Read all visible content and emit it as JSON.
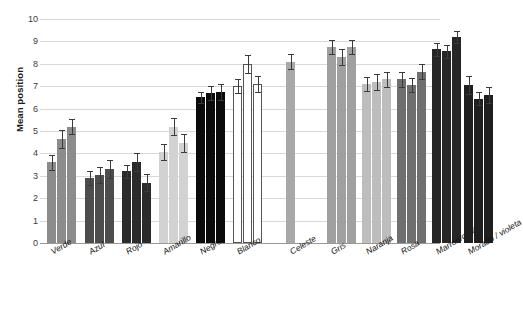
{
  "chart_data": {
    "type": "bar",
    "title": "",
    "xlabel": "",
    "ylabel": "Mean position",
    "ylim": [
      0,
      10
    ],
    "ytick_labels": [
      "0",
      "1",
      "2",
      "3",
      "4",
      "5",
      "6",
      "7",
      "8",
      "9",
      "10"
    ],
    "grid": true,
    "legend": "none",
    "error_bars": true,
    "categories": [
      "Verde",
      "Azul",
      "Rojo",
      "Amarillo",
      "Negro",
      "Blanco",
      "Celeste",
      "Gris",
      "Naranja",
      "Rosa",
      "Marrón/café",
      "Morado / violeta"
    ],
    "groups": [
      {
        "label": "Verde",
        "fill": "#8c8c8c",
        "bars": [
          {
            "value": 3.6,
            "err_low": 0.35,
            "err_high": 0.35
          },
          {
            "value": 4.65,
            "err_low": 0.4,
            "err_high": 0.4
          },
          {
            "value": 5.2,
            "err_low": 0.35,
            "err_high": 0.35
          }
        ]
      },
      {
        "label": "Azul",
        "fill": "#4d4d4d",
        "bars": [
          {
            "value": 2.9,
            "err_low": 0.3,
            "err_high": 0.3
          },
          {
            "value": 3.05,
            "err_low": 0.35,
            "err_high": 0.35
          },
          {
            "value": 3.3,
            "err_low": 0.4,
            "err_high": 0.4
          }
        ]
      },
      {
        "label": "Rojo",
        "fill": "#2b2b2b",
        "bars": [
          {
            "value": 3.2,
            "err_low": 0.3,
            "err_high": 0.3
          },
          {
            "value": 3.6,
            "err_low": 0.4,
            "err_high": 0.4
          },
          {
            "value": 2.7,
            "err_low": 0.4,
            "err_high": 0.4
          }
        ]
      },
      {
        "label": "Amarillo",
        "fill": "#d2d2d2",
        "bars": [
          {
            "value": 4.05,
            "err_low": 0.35,
            "err_high": 0.35
          },
          {
            "value": 5.2,
            "err_low": 0.4,
            "err_high": 0.4
          },
          {
            "value": 4.45,
            "err_low": 0.4,
            "err_high": 0.4
          }
        ]
      },
      {
        "label": "Negro",
        "fill": "#0b0b0b",
        "bars": [
          {
            "value": 6.5,
            "err_low": 0.25,
            "err_high": 0.25
          },
          {
            "value": 6.7,
            "err_low": 0.3,
            "err_high": 0.3
          },
          {
            "value": 6.75,
            "err_low": 0.35,
            "err_high": 0.35
          }
        ]
      },
      {
        "label": "Blanco",
        "fill": "#ffffff",
        "bars": [
          {
            "value": 7.0,
            "err_low": 0.3,
            "err_high": 0.3
          },
          {
            "value": 8.0,
            "err_low": 0.4,
            "err_high": 0.4
          },
          {
            "value": 7.1,
            "err_low": 0.35,
            "err_high": 0.35
          }
        ]
      },
      {
        "label": "Celeste",
        "fill": "#a8a8a8",
        "bars": [
          {
            "value": 8.1,
            "err_low": 0.35,
            "err_high": 0.35
          }
        ]
      },
      {
        "label": "Gris",
        "fill": "#a0a0a0",
        "bars": [
          {
            "value": 8.75,
            "err_low": 0.3,
            "err_high": 0.3
          },
          {
            "value": 8.3,
            "err_low": 0.35,
            "err_high": 0.35
          },
          {
            "value": 8.75,
            "err_low": 0.3,
            "err_high": 0.3
          }
        ]
      },
      {
        "label": "Naranja",
        "fill": "#bdbdbd",
        "bars": [
          {
            "value": 7.1,
            "err_low": 0.3,
            "err_high": 0.3
          },
          {
            "value": 7.2,
            "err_low": 0.35,
            "err_high": 0.35
          },
          {
            "value": 7.3,
            "err_low": 0.35,
            "err_high": 0.35
          }
        ]
      },
      {
        "label": "Rosa",
        "fill": "#6f6f6f",
        "bars": [
          {
            "value": 7.3,
            "err_low": 0.35,
            "err_high": 0.35
          },
          {
            "value": 7.05,
            "err_low": 0.3,
            "err_high": 0.3
          },
          {
            "value": 7.65,
            "err_low": 0.35,
            "err_high": 0.35
          }
        ]
      },
      {
        "label": "Marrón/café",
        "fill": "#262626",
        "bars": [
          {
            "value": 8.65,
            "err_low": 0.3,
            "err_high": 0.3
          },
          {
            "value": 8.55,
            "err_low": 0.3,
            "err_high": 0.3
          },
          {
            "value": 9.2,
            "err_low": 0.25,
            "err_high": 0.25
          }
        ]
      },
      {
        "label": "Morado / violeta",
        "fill": "#1f1f1f",
        "bars": [
          {
            "value": 7.05,
            "err_low": 0.4,
            "err_high": 0.4
          },
          {
            "value": 6.45,
            "err_low": 0.3,
            "err_high": 0.3
          },
          {
            "value": 6.6,
            "err_low": 0.35,
            "err_high": 0.35
          }
        ]
      }
    ]
  }
}
